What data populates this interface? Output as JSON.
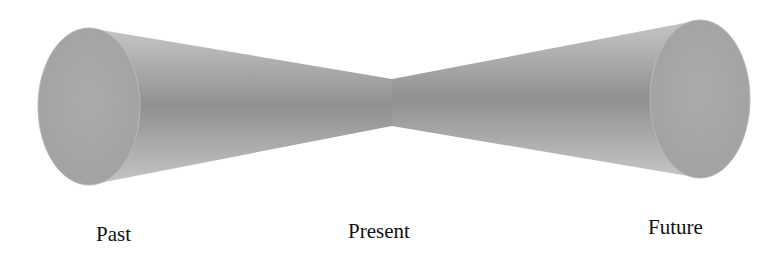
{
  "diagram": {
    "type": "light-cone-timeline",
    "labels": {
      "past": "Past",
      "present": "Present",
      "future": "Future"
    },
    "colors": {
      "cone_light": "#c2c2c2",
      "cone_dark": "#8f8f8f",
      "ellipse_face": "#a9a9a9",
      "text": "#111111"
    }
  }
}
